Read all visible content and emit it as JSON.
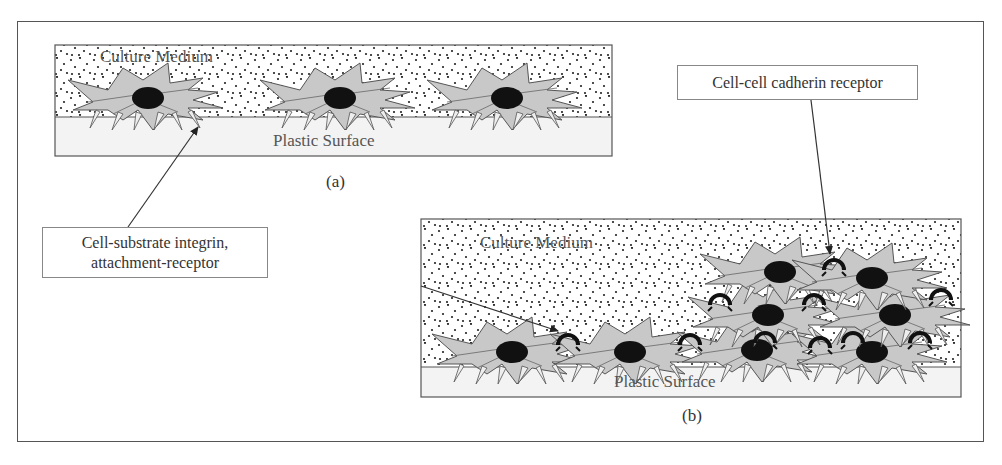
{
  "figure": {
    "panels": [
      {
        "id": "a",
        "caption": "(a)",
        "medium_label": "Culture Medium",
        "surface_label": "Plastic Surface",
        "cell_count": 3,
        "arrangement": "monolayer, cells spread and separated"
      },
      {
        "id": "b",
        "caption": "(b)",
        "medium_label": "Culture Medium",
        "surface_label": "Plastic Surface",
        "cell_count": 9,
        "arrangement": "confluent, cells multilayered with cell-cell contacts"
      }
    ],
    "callouts": [
      {
        "id": "integrin",
        "text_line1": "Cell-substrate integrin,",
        "text_line2": "attachment-receptor"
      },
      {
        "id": "cadherin",
        "text_line1": "Cell-cell cadherin receptor"
      }
    ],
    "colors": {
      "cell_body": "#c8c8c8",
      "nucleus": "#111111",
      "surface": "#f3f3f3",
      "medium_dots": "#222222",
      "outline": "#555555",
      "cadherin": "#111111"
    }
  }
}
